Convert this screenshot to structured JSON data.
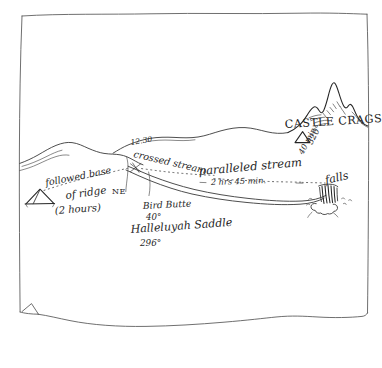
{
  "document": {
    "kind": "hand-drawn sketch map",
    "title": "Trail route sketch"
  },
  "labels": {
    "castle_crags": "CASTLE CRAGS",
    "crags_bearing": "320°",
    "crags_time": "40 min",
    "crossed_time": "12.30",
    "crossed_stream": "crossed stream",
    "followed_base": "followed base",
    "of_ridge": "of ridge",
    "direction_ne": "NE",
    "hours_two": "(2 hours)",
    "paralleled_stream": "paralleled stream",
    "paralleled_duration": "2 hrs  45 min.",
    "bird_butte": "Bird Butte",
    "bird_butte_bearing": "40°",
    "halleluyah_saddle": "Halleluyah Saddle",
    "halleluyah_bearing": "296°",
    "falls": "falls"
  },
  "symbols": {
    "tent": "tent-symbol",
    "crags_triangle": "survey-triangle-symbol",
    "crossing_x": "x-marker-symbol",
    "waterfall": "waterfall-symbol",
    "peak": "mountain-peak-symbol"
  },
  "colors": {
    "ink": "#3a3a3a",
    "ink_dark": "#262626",
    "paper": "#ffffff",
    "edge": "#555555"
  }
}
